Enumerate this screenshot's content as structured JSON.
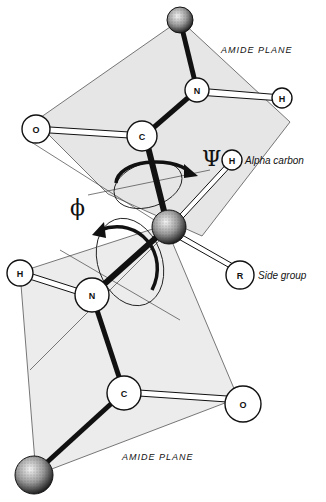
{
  "figure": {
    "planes": [
      {
        "label": "AMIDE PLANE",
        "position": "top"
      },
      {
        "label": "AMIDE PLANE",
        "position": "bottom"
      }
    ],
    "atoms": {
      "top_alpha": "",
      "top_n": "N",
      "top_h": "H",
      "top_o": "O",
      "top_c": "C",
      "alpha_carbon_h": "H",
      "side_group_r": "R",
      "bottom_h": "H",
      "bottom_n": "N",
      "bottom_c": "C",
      "bottom_o": "O",
      "bottom_alpha": ""
    },
    "callouts": {
      "alpha_carbon": "Alpha carbon",
      "side_group": "Side group"
    },
    "angles": {
      "psi": "Ψ",
      "phi": "ϕ"
    },
    "colors": {
      "plane_fill": "#e6e6e6",
      "plane_stroke": "#555555",
      "bond": "#111111",
      "atom_fill": "#ffffff"
    }
  }
}
